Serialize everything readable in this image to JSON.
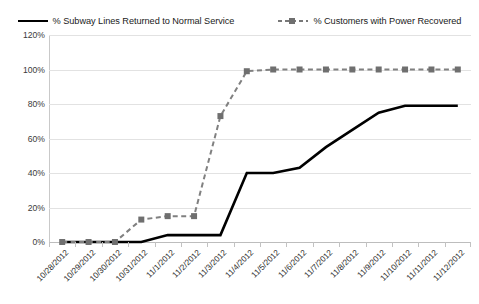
{
  "legend": {
    "position": "top-center",
    "entries": [
      {
        "label": "% Subway Lines Returned to Normal Service",
        "style": "solid",
        "color": "#000000"
      },
      {
        "label": "% Customers with Power Recovered",
        "style": "dashed-marker",
        "color": "#808080"
      }
    ]
  },
  "chart_data": {
    "type": "line",
    "title": "",
    "xlabel": "",
    "ylabel": "",
    "ylim": [
      0,
      120
    ],
    "ytick_labels": [
      "120%",
      "100%",
      "80%",
      "60%",
      "40%",
      "20%",
      "0%"
    ],
    "ytick_values": [
      120,
      100,
      80,
      60,
      40,
      20,
      0
    ],
    "grid": true,
    "legend_position": "top-center",
    "categories": [
      "10/28/2012",
      "10/29/2012",
      "10/30/2012",
      "10/31/2012",
      "11/1/2012",
      "11/2/2012",
      "11/3/2012",
      "11/4/2012",
      "11/5/2012",
      "11/6/2012",
      "11/7/2012",
      "11/8/2012",
      "11/9/2012",
      "11/10/2012",
      "11/11/2012",
      "11/12/2012"
    ],
    "series": [
      {
        "name": "% Subway Lines Returned to Normal Service",
        "color": "#000000",
        "style": "solid",
        "markers": false,
        "values": [
          0,
          0,
          0,
          0,
          4,
          4,
          4,
          40,
          40,
          43,
          55,
          65,
          75,
          79,
          79,
          79
        ]
      },
      {
        "name": "% Customers with Power Recovered",
        "color": "#808080",
        "style": "dashed",
        "markers": true,
        "values": [
          0,
          0,
          0,
          13,
          15,
          15,
          73,
          99,
          100,
          100,
          100,
          100,
          100,
          100,
          100,
          100
        ]
      }
    ]
  }
}
